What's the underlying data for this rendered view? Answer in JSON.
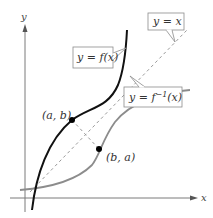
{
  "diagram": {
    "axes": {
      "x_label": "x",
      "y_label": "y"
    },
    "curves": [
      {
        "name": "f",
        "label": "y = f(x)",
        "color": "#111111",
        "style": "solid"
      },
      {
        "name": "f_inverse",
        "label_prefix": "y = f",
        "label_sup": "−1",
        "label_suffix": "(x)",
        "color": "#8c8c8c",
        "style": "solid"
      },
      {
        "name": "identity",
        "label": "y = x",
        "color": "#8c8c8c",
        "style": "dashed"
      }
    ],
    "points": [
      {
        "label": "(a, b)",
        "on": "f"
      },
      {
        "label": "(b, a)",
        "on": "f_inverse"
      }
    ]
  }
}
